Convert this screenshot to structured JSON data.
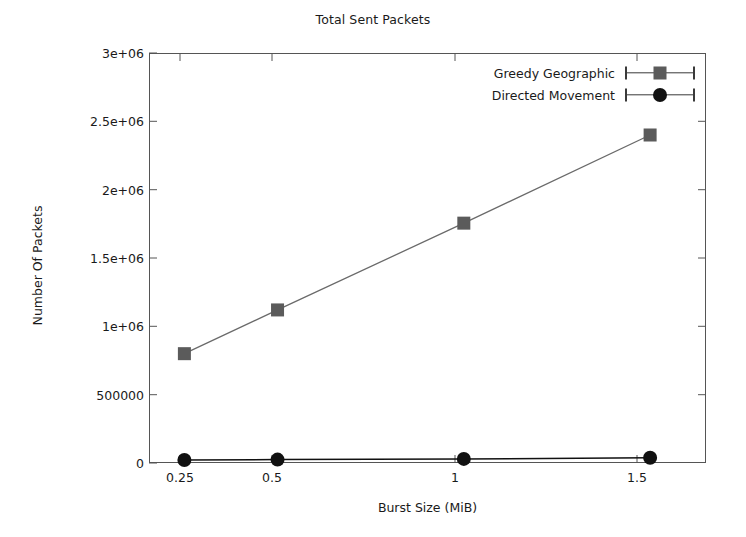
{
  "chart_data": {
    "type": "line",
    "title": "Total Sent Packets",
    "xlabel": "Burst Size (MiB)",
    "ylabel": "Number Of Packets",
    "x": [
      0.25,
      0.5,
      1,
      1.5
    ],
    "xtick_labels": [
      "0.25",
      "0.5",
      "1",
      "1.5"
    ],
    "ytick_labels": [
      "0",
      "500000",
      "1e+06",
      "1.5e+06",
      "2e+06",
      "2.5e+06",
      "3e+06"
    ],
    "ytick_values": [
      0,
      500000,
      1000000,
      1500000,
      2000000,
      2500000,
      3000000
    ],
    "xlim": [
      0.155,
      1.65
    ],
    "ylim": [
      0,
      3000000
    ],
    "grid": false,
    "legend_position": "top-right-inside",
    "series": [
      {
        "name": "Greedy Geographic",
        "marker": "square",
        "color": "#5b5b5b",
        "line_color": "#6a6a6a",
        "values": [
          800000,
          1120000,
          1755000,
          2400000
        ]
      },
      {
        "name": "Directed Movement",
        "marker": "circle",
        "color": "#111111",
        "line_color": "#111111",
        "values": [
          22000,
          25000,
          30000,
          38000
        ]
      }
    ]
  },
  "figure": {
    "background": "#ffffff",
    "frame_color": "#555555",
    "text_color": "#1a1a1a"
  }
}
